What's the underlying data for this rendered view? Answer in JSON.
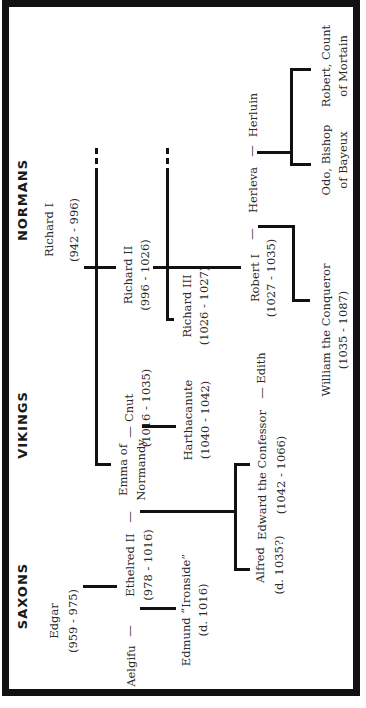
{
  "diagram": {
    "orientation": "rotated -90deg (reads bottom to top)",
    "headers": {
      "saxons": "SAXONS",
      "vikings": "VIKINGS",
      "normans": "NORMANS"
    },
    "people": {
      "edgar": {
        "name": "Edgar",
        "dates": "(959 - 975)"
      },
      "richard1": {
        "name": "Richard I",
        "dates": "(942 - 996)"
      },
      "aelgifu": {
        "name": "Aelgifu"
      },
      "ethelred2": {
        "name": "Ethelred II",
        "dates": "(978 - 1016)"
      },
      "emma": {
        "name_line1": "Emma of",
        "name_line2": "Normandy"
      },
      "cnut": {
        "name": "Cnut",
        "dates": "(1016 - 1035)"
      },
      "richard2": {
        "name": "Richard II",
        "dates": "(996 - 1026)"
      },
      "edmund": {
        "name": "Edmund “Ironside”",
        "dates": "(d. 1016)"
      },
      "harthacanute": {
        "name": "Harthacanute",
        "dates": "(1040 - 1042)"
      },
      "richard3": {
        "name": "Richard III",
        "dates": "(1026 - 1027)"
      },
      "alfred": {
        "name": "Alfred",
        "dates": "(d. 1035?)"
      },
      "edward": {
        "name": "Edward the Confessor",
        "dates": "(1042 - 1066)"
      },
      "edith": {
        "name": "Edith"
      },
      "robert1": {
        "name": "Robert I",
        "dates": "(1027 - 1035)"
      },
      "herleva": {
        "name": "Herleva"
      },
      "herluin": {
        "name": "Herluin"
      },
      "william": {
        "name": "William the Conqueror",
        "dates": "(1035 - 1087)"
      },
      "odo": {
        "name_line1": "Odo, Bishop",
        "name_line2": "of Bayeux"
      },
      "robert_count": {
        "name_line1": "Robert, Count",
        "name_line2": "of Mortain"
      }
    },
    "marriage_symbol": "—",
    "colors": {
      "line": "#111111",
      "text": "#2a2a2a",
      "border": "#111111",
      "background": "#ffffff"
    }
  }
}
